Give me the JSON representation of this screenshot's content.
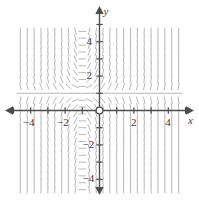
{
  "figure": {
    "kind": "slope-field-plot",
    "width": 199,
    "height": 200,
    "background_color": "#ffffff"
  },
  "axes": {
    "x_label": "x",
    "y_label": "y",
    "axis_color": "#4d4d4d",
    "origin_marker": "open-circle",
    "x_range": [
      -5.2,
      5.2
    ],
    "y_range": [
      -5.2,
      5.2
    ],
    "tick_step": 1,
    "x_tick_labels": [
      {
        "value": -4,
        "text": "−4"
      },
      {
        "value": -2,
        "text": "−2"
      },
      {
        "value": 2,
        "text": "2"
      },
      {
        "value": 4,
        "text": "4"
      }
    ],
    "y_tick_labels": [
      {
        "value": 4,
        "text": "4"
      },
      {
        "value": 2,
        "text": "2"
      },
      {
        "value": -2,
        "text": "−2"
      },
      {
        "value": -4,
        "text": "−4"
      }
    ]
  },
  "chart_data": {
    "type": "line",
    "title": "",
    "xlabel": "x",
    "ylabel": "y",
    "xlim": [
      -5.2,
      5.2
    ],
    "ylim": [
      -5.2,
      5.2
    ],
    "grid": false,
    "legend": "none",
    "field": {
      "description": "direction field of dy/dx with near-horizontal slopes along the line y = 1",
      "equilibrium_line_y": 1,
      "segment_color": "#b9b9bd",
      "segment_length": 7.5,
      "x_samples": [
        -4.6,
        -4.2,
        -3.8,
        -3.4,
        -3.0,
        -2.6,
        -2.2,
        -1.8,
        -1.4,
        -1.0,
        -0.6,
        -0.2,
        0.2,
        0.6,
        1.0,
        1.4,
        1.8,
        2.2,
        2.6,
        3.0,
        3.4,
        3.8,
        4.2,
        4.6
      ],
      "y_samples": [
        -4.6,
        -4.2,
        -3.8,
        -3.4,
        -3.0,
        -2.6,
        -2.2,
        -1.8,
        -1.4,
        -1.0,
        -0.6,
        -0.2,
        0.2,
        0.6,
        1.0,
        1.4,
        1.8,
        2.2,
        2.6,
        3.0,
        3.4,
        3.8,
        4.2,
        4.6
      ],
      "slope_formula": "dy/dx = (y - 1) * (1 + x) * 3"
    }
  }
}
